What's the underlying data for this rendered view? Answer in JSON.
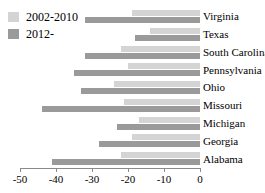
{
  "chart_data": {
    "type": "bar",
    "orientation": "horizontal",
    "title": "",
    "xlabel": "",
    "ylabel": "",
    "xlim": [
      -50,
      0
    ],
    "xticks": [
      -50,
      -40,
      -30,
      -20,
      -10,
      0
    ],
    "xtick_labels": [
      "-50",
      "-40",
      "-30",
      "-20",
      "-10",
      "0"
    ],
    "grid": false,
    "legend_position": "top-left",
    "categories": [
      "Virginia",
      "Texas",
      "South Carolina",
      "Pennsylvania",
      "Ohio",
      "Missouri",
      "Michigan",
      "Georgia",
      "Alabama"
    ],
    "series": [
      {
        "name": "2002-2010",
        "color": "#d4d4d4",
        "values": [
          -19,
          -14,
          -22,
          -20,
          -24,
          -21,
          -17,
          -19,
          -22
        ]
      },
      {
        "name": "2012-",
        "color": "#9a9a9a",
        "values": [
          -32,
          -18,
          -32,
          -35,
          -33,
          -44,
          -23,
          -28,
          -41
        ]
      }
    ]
  }
}
